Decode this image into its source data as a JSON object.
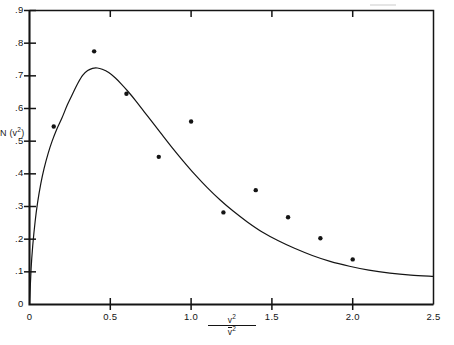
{
  "figure": {
    "background_color": "#ffffff",
    "ink_color": "#141414"
  },
  "axes": {
    "x_label_numerator": "v",
    "x_label_numerator_exp": "2",
    "x_label_denominator": "v",
    "x_label_denominator_exp": "2",
    "y_label_prefix": "N (v",
    "y_label_exp": "2",
    "y_label_suffix": ")",
    "x_tick_labels": [
      "0",
      "0.5",
      "1.0",
      "1.5",
      "2.0",
      "2.5"
    ],
    "y_tick_labels": [
      "0",
      ".1",
      ".2",
      ".3",
      ".4",
      ".5",
      ".6",
      ".7",
      ".8",
      ".9"
    ],
    "x_origin_label": "0"
  },
  "chart_data": {
    "type": "scatter",
    "title": "",
    "xlabel": "v^2 / v̄^2",
    "ylabel": "N(v^2)",
    "xlim": [
      0,
      2.5
    ],
    "ylim": [
      0,
      0.9
    ],
    "grid": false,
    "legend": "none",
    "x_ticks": [
      0,
      0.5,
      1.0,
      1.5,
      2.0,
      2.5
    ],
    "y_ticks": [
      0,
      0.1,
      0.2,
      0.3,
      0.4,
      0.5,
      0.6,
      0.7,
      0.8,
      0.9
    ],
    "x_minor_ticks_top": [
      0.5,
      1.0,
      1.5,
      2.0
    ],
    "series": [
      {
        "name": "measured points",
        "type": "scatter",
        "marker": "filled-circle",
        "marker_size_px": 4.4,
        "color": "#141414",
        "points": [
          {
            "x": 0.15,
            "y": 0.545
          },
          {
            "x": 0.4,
            "y": 0.775
          },
          {
            "x": 0.6,
            "y": 0.645
          },
          {
            "x": 0.8,
            "y": 0.452
          },
          {
            "x": 1.0,
            "y": 0.56
          },
          {
            "x": 1.2,
            "y": 0.282
          },
          {
            "x": 1.4,
            "y": 0.35
          },
          {
            "x": 1.6,
            "y": 0.267
          },
          {
            "x": 1.8,
            "y": 0.203
          },
          {
            "x": 2.0,
            "y": 0.138
          }
        ]
      },
      {
        "name": "theoretical curve",
        "type": "line",
        "color": "#141414",
        "width_px": 1.2,
        "points": [
          {
            "x": 0.0,
            "y": 0.0
          },
          {
            "x": 0.01,
            "y": 0.11
          },
          {
            "x": 0.02,
            "y": 0.18
          },
          {
            "x": 0.035,
            "y": 0.255
          },
          {
            "x": 0.05,
            "y": 0.312
          },
          {
            "x": 0.07,
            "y": 0.37
          },
          {
            "x": 0.09,
            "y": 0.416
          },
          {
            "x": 0.115,
            "y": 0.462
          },
          {
            "x": 0.14,
            "y": 0.5
          },
          {
            "x": 0.17,
            "y": 0.538
          },
          {
            "x": 0.2,
            "y": 0.57
          },
          {
            "x": 0.235,
            "y": 0.612
          },
          {
            "x": 0.27,
            "y": 0.648
          },
          {
            "x": 0.3,
            "y": 0.678
          },
          {
            "x": 0.33,
            "y": 0.702
          },
          {
            "x": 0.36,
            "y": 0.716
          },
          {
            "x": 0.39,
            "y": 0.723
          },
          {
            "x": 0.42,
            "y": 0.724
          },
          {
            "x": 0.45,
            "y": 0.72
          },
          {
            "x": 0.49,
            "y": 0.71
          },
          {
            "x": 0.53,
            "y": 0.694
          },
          {
            "x": 0.57,
            "y": 0.674
          },
          {
            "x": 0.61,
            "y": 0.652
          },
          {
            "x": 0.66,
            "y": 0.622
          },
          {
            "x": 0.71,
            "y": 0.59
          },
          {
            "x": 0.76,
            "y": 0.558
          },
          {
            "x": 0.82,
            "y": 0.52
          },
          {
            "x": 0.88,
            "y": 0.482
          },
          {
            "x": 0.95,
            "y": 0.44
          },
          {
            "x": 1.02,
            "y": 0.4
          },
          {
            "x": 1.1,
            "y": 0.358
          },
          {
            "x": 1.18,
            "y": 0.32
          },
          {
            "x": 1.26,
            "y": 0.286
          },
          {
            "x": 1.35,
            "y": 0.252
          },
          {
            "x": 1.44,
            "y": 0.222
          },
          {
            "x": 1.54,
            "y": 0.195
          },
          {
            "x": 1.64,
            "y": 0.172
          },
          {
            "x": 1.75,
            "y": 0.15
          },
          {
            "x": 1.86,
            "y": 0.132
          },
          {
            "x": 1.98,
            "y": 0.117
          },
          {
            "x": 2.1,
            "y": 0.105
          },
          {
            "x": 2.23,
            "y": 0.096
          },
          {
            "x": 2.36,
            "y": 0.09
          },
          {
            "x": 2.5,
            "y": 0.086
          }
        ]
      }
    ]
  }
}
